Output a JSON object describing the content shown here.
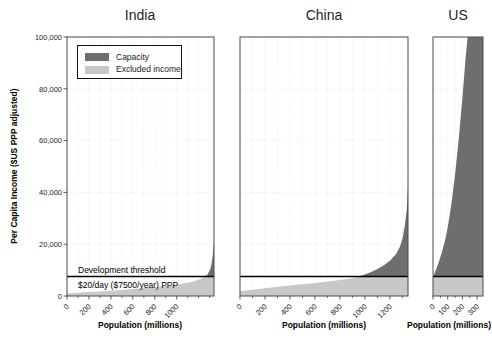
{
  "chart_data": {
    "type": "area",
    "ylabel": "Per Capita Income ($US PPP adjusted)",
    "ylim": [
      0,
      100000
    ],
    "yticks": [
      {
        "value": 0,
        "label": "0"
      },
      {
        "value": 20000,
        "label": "20,000"
      },
      {
        "value": 40000,
        "label": "40,000"
      },
      {
        "value": 60000,
        "label": "60,000"
      },
      {
        "value": 80000,
        "label": "80,000"
      },
      {
        "value": 100000,
        "label": "100,000"
      }
    ],
    "grid": true,
    "legend": {
      "position": "upper-left of India panel",
      "items": [
        {
          "label": "Capacity",
          "color": "#6e6e6e"
        },
        {
          "label": "Excluded income",
          "color": "#c8c8c8"
        }
      ]
    },
    "threshold": {
      "value": 7500,
      "label": "Development threshold",
      "sublabel": "$20/day ($7500/year) PPP"
    },
    "panels": [
      {
        "title": "India",
        "xlabel": "Population (millions)",
        "xlim": [
          0,
          1340
        ],
        "xticks": [
          0,
          200,
          400,
          600,
          800,
          1000
        ],
        "minor_step": 100,
        "income_curve": [
          [
            0,
            1000
          ],
          [
            100,
            1250
          ],
          [
            200,
            1500
          ],
          [
            300,
            1750
          ],
          [
            400,
            2050
          ],
          [
            500,
            2350
          ],
          [
            600,
            2700
          ],
          [
            700,
            3050
          ],
          [
            800,
            3450
          ],
          [
            900,
            3900
          ],
          [
            1000,
            4400
          ],
          [
            1100,
            5100
          ],
          [
            1150,
            5600
          ],
          [
            1200,
            6300
          ],
          [
            1250,
            7300
          ],
          [
            1280,
            8200
          ],
          [
            1300,
            9800
          ],
          [
            1310,
            11000
          ],
          [
            1320,
            13000
          ],
          [
            1330,
            16000
          ],
          [
            1340,
            21000
          ]
        ]
      },
      {
        "title": "China",
        "xlabel": "Population (millions)",
        "xlim": [
          0,
          1345
        ],
        "xticks": [
          0,
          200,
          400,
          600,
          800,
          1000,
          1200
        ],
        "minor_step": 100,
        "income_curve": [
          [
            0,
            1800
          ],
          [
            100,
            2400
          ],
          [
            200,
            3000
          ],
          [
            300,
            3550
          ],
          [
            400,
            4100
          ],
          [
            500,
            4550
          ],
          [
            600,
            5050
          ],
          [
            700,
            5550
          ],
          [
            800,
            6150
          ],
          [
            900,
            6850
          ],
          [
            950,
            7500
          ],
          [
            1000,
            8300
          ],
          [
            1050,
            9300
          ],
          [
            1100,
            10400
          ],
          [
            1150,
            11800
          ],
          [
            1200,
            13600
          ],
          [
            1250,
            16200
          ],
          [
            1280,
            19000
          ],
          [
            1300,
            22000
          ],
          [
            1320,
            27500
          ],
          [
            1335,
            33500
          ],
          [
            1345,
            42500
          ]
        ]
      },
      {
        "title": "US",
        "xlabel": "Population (millions)",
        "xlim": [
          0,
          340
        ],
        "xticks": [
          0,
          100,
          200,
          300
        ],
        "minor_step": 50,
        "income_curve": [
          [
            0,
            7500
          ],
          [
            20,
            10000
          ],
          [
            40,
            13200
          ],
          [
            60,
            16800
          ],
          [
            80,
            21000
          ],
          [
            100,
            26500
          ],
          [
            125,
            35500
          ],
          [
            150,
            47000
          ],
          [
            175,
            60500
          ],
          [
            200,
            76500
          ],
          [
            220,
            91000
          ],
          [
            235,
            101000
          ],
          [
            260,
            120000
          ],
          [
            300,
            150000
          ],
          [
            340,
            185000
          ]
        ]
      }
    ]
  },
  "style": {
    "capacity_color": "#6e6e6e",
    "excluded_color": "#c8c8c8",
    "threshold_line_color": "#000000",
    "grid_color": "#e3e3e3",
    "spine_color": "#4a4a4a",
    "tick_color": "#333333",
    "text_color": "#262626"
  }
}
